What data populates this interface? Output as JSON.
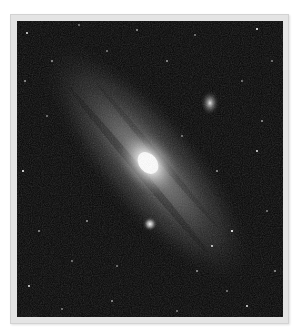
{
  "image": {
    "subject": "Andromeda galaxy photograph",
    "alt": "Spiral galaxy with bright core and two companion galaxies against a star field",
    "colors": {
      "page_background": "#ffffff",
      "frame": "#e4e4e4",
      "sky": "#050505",
      "core": "#ffffff"
    },
    "features": {
      "core": {
        "x": 131,
        "y": 142
      },
      "companion_upper": {
        "x": 193,
        "y": 82
      },
      "companion_lower": {
        "x": 133,
        "y": 203
      }
    }
  }
}
